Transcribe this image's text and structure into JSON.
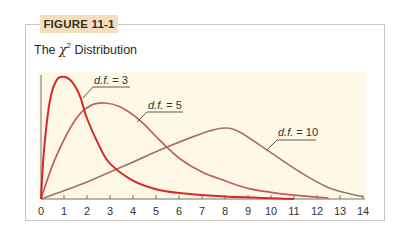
{
  "figure": {
    "label": "FIGURE 11-1",
    "title_prefix": "The ",
    "title_symbol": "χ",
    "title_superscript": "2",
    "title_suffix": " Distribution"
  },
  "colors": {
    "label_bg": "#f1e0bb",
    "plot_bg": "#fdf9e6",
    "axis": "#7a6f66"
  },
  "chart_data": {
    "type": "line",
    "xlabel": "",
    "ylabel": "",
    "xlim": [
      0,
      14
    ],
    "x_ticks": [
      0,
      1,
      2,
      3,
      4,
      5,
      6,
      7,
      8,
      9,
      10,
      11,
      12,
      13,
      14
    ],
    "y_axis_ticks": false,
    "grid": false,
    "legend": "inline labels with leader lines",
    "series": [
      {
        "name": "d.f. = 3",
        "label": "d.f. = 3",
        "color": "#d42a2a",
        "x": [
          0,
          0.13,
          0.39,
          0.7,
          1.04,
          1.35,
          1.7,
          2.0,
          2.57,
          3.0,
          4.0,
          5.0,
          6.0,
          8.0,
          11.0
        ],
        "y_rel": [
          0,
          0.4,
          0.81,
          0.98,
          1.0,
          0.96,
          0.84,
          0.66,
          0.42,
          0.29,
          0.15,
          0.08,
          0.05,
          0.02,
          0
        ]
      },
      {
        "name": "d.f. = 5",
        "label": "d.f. = 5",
        "color": "#c75a5a",
        "x": [
          0,
          0.6,
          1.48,
          2.13,
          2.78,
          3.43,
          4.3,
          5.17,
          6.04,
          7.0,
          8.0,
          9.0,
          10.0,
          11.0,
          12.5
        ],
        "y_rel": [
          0,
          0.41,
          0.82,
          0.97,
          1.0,
          0.96,
          0.82,
          0.61,
          0.42,
          0.28,
          0.19,
          0.11,
          0.07,
          0.04,
          0.01
        ]
      },
      {
        "name": "d.f. = 10",
        "label": "d.f. = 10",
        "color": "#a5706e",
        "x": [
          0,
          1.7,
          3.0,
          4.0,
          5.17,
          6.48,
          7.35,
          8.0,
          8.65,
          9.96,
          11.26,
          12.57,
          14.0
        ],
        "y_rel": [
          0,
          0.2,
          0.38,
          0.52,
          0.69,
          0.86,
          0.96,
          1.0,
          0.94,
          0.66,
          0.38,
          0.15,
          0.03
        ]
      }
    ],
    "peak_heights_px": {
      "d.f. = 3": 122,
      "d.f. = 5": 96,
      "d.f. = 10": 71
    }
  }
}
